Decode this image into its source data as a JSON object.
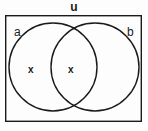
{
  "diagram": {
    "type": "venn-diagram",
    "universe": {
      "label": "u",
      "name": "universal-set",
      "rect": {
        "x": 5,
        "y": 15,
        "width": 137,
        "height": 107
      }
    },
    "sets": [
      {
        "id": "a",
        "label": "a",
        "name": "set-a",
        "circle": {
          "cx": 53,
          "cy": 67,
          "r": 44
        }
      },
      {
        "id": "b",
        "label": "b",
        "name": "set-b",
        "circle": {
          "cx": 95,
          "cy": 67,
          "r": 44
        }
      }
    ],
    "marks": [
      {
        "id": "a-only",
        "label": "x",
        "region": "a-only",
        "x": 32,
        "y": 69
      },
      {
        "id": "a-and-b",
        "label": "x",
        "region": "intersection",
        "x": 72,
        "y": 69
      }
    ],
    "colors": {
      "stroke": "#1a1a1a",
      "background": "#fdfdfd",
      "fill": "none",
      "text": "#1a1a1a"
    },
    "stroke_width": 1.4
  }
}
